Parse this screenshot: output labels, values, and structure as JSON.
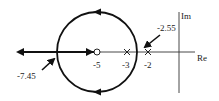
{
  "diagram": {
    "type": "root-locus",
    "axes": {
      "real_label": "Re",
      "imag_label": "Im"
    },
    "zeros": [
      {
        "value": -5,
        "label": "-5",
        "marker": "O"
      }
    ],
    "poles": [
      {
        "value": -3,
        "label": "-3",
        "marker": "X"
      },
      {
        "value": -2,
        "label": "-2",
        "marker": "X"
      }
    ],
    "breakpoints": [
      {
        "value": -2.55,
        "label": "-2.55",
        "kind": "break-away"
      },
      {
        "value": -7.45,
        "label": "-7.45",
        "kind": "break-in"
      }
    ],
    "locus": {
      "shape": "circle",
      "center": -5,
      "direction": "counter-clockwise"
    },
    "colors": {
      "line": "#111111",
      "text": "#222222",
      "background": "#ffffff"
    }
  }
}
